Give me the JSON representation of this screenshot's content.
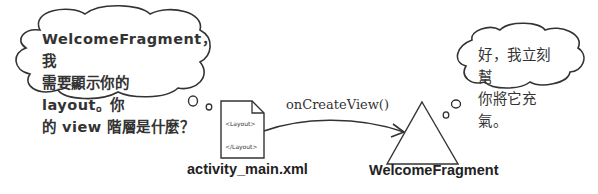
{
  "left_bubble": {
    "lines": [
      "WelcomeFragment，我",
      "需要顯示你的 layout。你",
      "的 view 階層是什麼？"
    ]
  },
  "right_bubble": {
    "lines": [
      "好，我立刻幫",
      "你將它充氣。"
    ]
  },
  "document": {
    "open_tag": "<Layout>",
    "close_tag": "</Layout>",
    "label": "activity_main.xml"
  },
  "arrow": {
    "label": "onCreateView()"
  },
  "fragment": {
    "label": "WelcomeFragment"
  }
}
